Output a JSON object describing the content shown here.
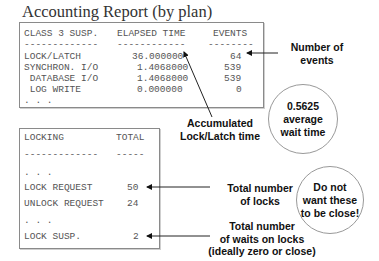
{
  "title": "Accounting Report (by plan)",
  "report1": {
    "headers": [
      "CLASS 3 SUSP.",
      "ELAPSED TIME",
      "EVENTS"
    ],
    "underlines": [
      "-------------",
      "------------",
      "--------"
    ],
    "rows": [
      {
        "label": "LOCK/LATCH",
        "elapsed": "36.000000",
        "events": "64"
      },
      {
        "label": "SYNCHRON. I/O",
        "elapsed": "1.4068000",
        "events": "539"
      },
      {
        "label": " DATABASE I/O",
        "elapsed": "1.4068000",
        "events": "539"
      },
      {
        "label": " LOG WRITE",
        "elapsed": "0.000000",
        "events": "0"
      }
    ],
    "ellipsis": ". . ."
  },
  "report2": {
    "headers": [
      "LOCKING",
      "TOTAL"
    ],
    "underlines": [
      "-------------",
      "-----"
    ],
    "ellipsis1": ". . .",
    "rows": [
      {
        "label": "LOCK REQUEST",
        "total": "50"
      },
      {
        "label": "UNLOCK REQUEST",
        "total": "24"
      }
    ],
    "ellipsis2": ". . .",
    "last_row": {
      "label": "LOCK SUSP.",
      "total": "2"
    }
  },
  "annotations": {
    "number_of_events": "Number of\nevents",
    "accumulated": "Accumulated\nLock/Latch time",
    "avg_wait": "0.5625\naverage\nwait time",
    "total_locks": "Total number\nof locks",
    "do_not": "Do not\nwant these\nto be close!",
    "total_waits": "Total number\nof waits on locks\n(ideally zero or close)"
  }
}
